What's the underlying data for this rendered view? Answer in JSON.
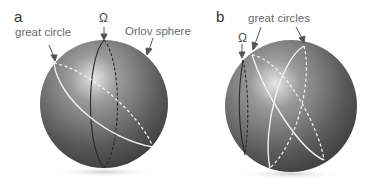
{
  "panels": [
    {
      "letter": "a",
      "labels": {
        "great_circle": "great circle",
        "omega": "Ω",
        "orlov_sphere": "Orlov sphere"
      },
      "sphere": {
        "cx": 104,
        "cy": 104,
        "r": 64
      },
      "curves": {
        "omega_line": "solid+dashed meridian (dark)",
        "great_circle": "solid white front, dashed white back"
      }
    },
    {
      "letter": "b",
      "labels": {
        "great_circles": "great circles",
        "omega": "Ω"
      },
      "sphere": {
        "cx": 291,
        "cy": 106,
        "r": 66
      },
      "curves": {
        "omega_line": "dark meridian near left limb",
        "great_circles": "two crossing great circles, solid white front, dashed white back"
      }
    }
  ],
  "colors": {
    "sphere_light": "#d8d8d8",
    "sphere_mid": "#8a8a8a",
    "sphere_dark": "#3e3e3e",
    "curve_white": "#f2f2f2",
    "curve_dark": "#2a2a2a",
    "arrow": "#555555",
    "text": "#666666"
  }
}
